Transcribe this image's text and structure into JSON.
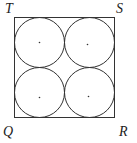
{
  "diagram": {
    "type": "geometry",
    "labels": {
      "T": "T",
      "S": "S",
      "Q": "Q",
      "R": "R"
    },
    "square": {
      "x": 14.5,
      "y": 17.5,
      "size": 100
    },
    "circles": [
      {
        "cx": 39.5,
        "cy": 42.5,
        "r": 25
      },
      {
        "cx": 89.5,
        "cy": 42.5,
        "r": 25
      },
      {
        "cx": 39.5,
        "cy": 92.5,
        "r": 25
      },
      {
        "cx": 89.5,
        "cy": 92.5,
        "r": 25
      }
    ],
    "stroke_color": "#333333"
  }
}
